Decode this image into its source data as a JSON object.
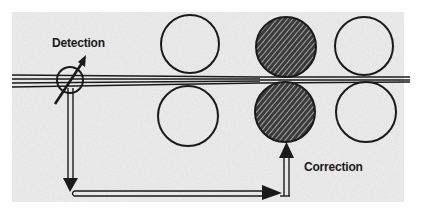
{
  "diagram": {
    "type": "rolling-mill strip thickness control schematic",
    "labels": {
      "detection": "Detection",
      "correction": "Correction"
    },
    "colors": {
      "background": "#ffffff",
      "panel": "#eeeeee",
      "line": "#1a1a1a",
      "hatch_fill": "#3a3a3a"
    },
    "components": {
      "strip": {
        "description": "metal strip passing horizontally through roll stands"
      },
      "sensor": {
        "description": "thickness detection gauge (circle with diagonal arrow) on strip"
      },
      "roll_stands": [
        {
          "name": "stand-1",
          "top_roll": "open",
          "bottom_roll": "open"
        },
        {
          "name": "stand-2",
          "top_roll": "hatched",
          "bottom_roll": "hatched",
          "role": "corrected stand"
        },
        {
          "name": "stand-3",
          "top_roll": "open",
          "bottom_roll": "open"
        }
      ],
      "feedback_path": {
        "description": "signal from detection down, right along bottom, then up to stand-2 bottom roll"
      }
    }
  }
}
